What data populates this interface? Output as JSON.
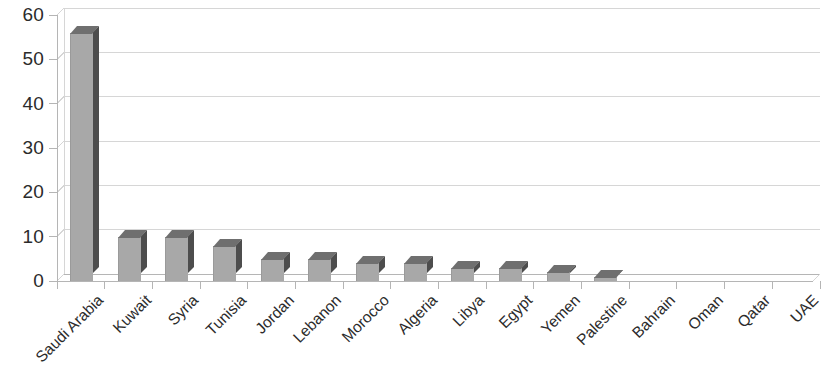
{
  "chart_data": {
    "type": "bar",
    "title": "",
    "subtitle": "",
    "xlabel": "",
    "ylabel": "",
    "ylim": [
      0,
      60
    ],
    "ytick_step": 10,
    "yticks": [
      "0",
      "10",
      "20",
      "30",
      "40",
      "50",
      "60"
    ],
    "grid": true,
    "grid_axis": "y",
    "legend": false,
    "legend_position": "none",
    "style": "3d-column",
    "categories": [
      "Saudi Arabia",
      "Kuwait",
      "Syria",
      "Tunisia",
      "Jordan",
      "Lebanon",
      "Morocco",
      "Algeria",
      "Libya",
      "Egypt",
      "Yemen",
      "Palestine",
      "Bahrain",
      "Oman",
      "Qatar",
      "UAE"
    ],
    "values": [
      56,
      10,
      10,
      8,
      5,
      5,
      4,
      4,
      3,
      3,
      2,
      1,
      0,
      0,
      0,
      0
    ],
    "series": [
      {
        "name": "",
        "values": [
          56,
          10,
          10,
          8,
          5,
          5,
          4,
          4,
          3,
          3,
          2,
          1,
          0,
          0,
          0,
          0
        ]
      }
    ]
  },
  "colors": {
    "bar_face": "#a8a8a8",
    "bar_side": "#4d4d4d",
    "bar_top": "#6f6f6f",
    "gridline": "#d6d6d6",
    "axis_line": "#b5b5b5",
    "text": "#2b2b2b",
    "background": "#ffffff"
  }
}
